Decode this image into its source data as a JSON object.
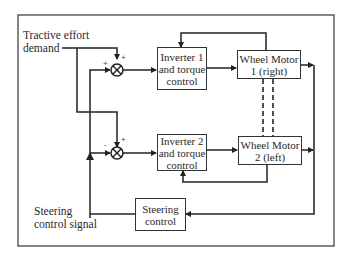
{
  "diagram": {
    "inputs": {
      "tractive_effort": "Tractive effort demand",
      "tractive_effort_line1": "Tractive effort",
      "tractive_effort_line2": "demand",
      "steering_signal_line1": "Steering",
      "steering_signal_line2": "control signal"
    },
    "blocks": [
      {
        "id": "inverter1",
        "line1": "Inverter 1",
        "line2": "and torque",
        "line3": "control"
      },
      {
        "id": "motor1",
        "line1": "Wheel Motor",
        "line2": "1 (right)"
      },
      {
        "id": "inverter2",
        "line1": "Inverter 2",
        "line2": "and torque",
        "line3": "control"
      },
      {
        "id": "motor2",
        "line1": "Wheel Motor",
        "line2": "2 (left)"
      },
      {
        "id": "steering",
        "line1": "Steering",
        "line2": "control"
      }
    ],
    "junctions": [
      {
        "id": "sum1",
        "signs": {
          "top": "+",
          "left": "+"
        }
      },
      {
        "id": "sum2",
        "signs": {
          "top": "+",
          "left": "-"
        }
      }
    ],
    "links": [
      {
        "from": "tractive_effort",
        "to": "sum1"
      },
      {
        "from": "tractive_effort",
        "to": "sum2"
      },
      {
        "from": "steering_signal",
        "to": "sum1"
      },
      {
        "from": "steering_signal",
        "to": "sum2"
      },
      {
        "from": "sum1",
        "to": "inverter1"
      },
      {
        "from": "inverter1",
        "to": "motor1"
      },
      {
        "from": "motor1",
        "to": "inverter1",
        "type": "feedback"
      },
      {
        "from": "sum2",
        "to": "inverter2"
      },
      {
        "from": "inverter2",
        "to": "motor2"
      },
      {
        "from": "motor2",
        "to": "inverter2",
        "type": "feedback"
      },
      {
        "from": "motor1",
        "to": "steering"
      },
      {
        "from": "motor2",
        "to": "steering"
      },
      {
        "from": "steering",
        "to": "steering_signal"
      },
      {
        "from": "motor1",
        "to": "motor2",
        "type": "mechanical-dashed"
      }
    ]
  }
}
